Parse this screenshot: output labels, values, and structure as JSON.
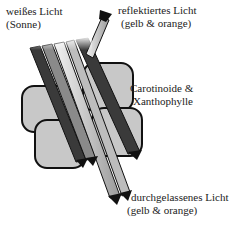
{
  "labels": {
    "incoming": {
      "line1": "weißes Licht",
      "line2": "(Sonne)"
    },
    "reflected": {
      "line1": "reflektiertes Licht",
      "line2": "(gelb & orange)"
    },
    "pigments": {
      "line1": "Carotinoide &",
      "line2": "Xanthophylle"
    },
    "transmitted": {
      "line1": "durchgelassenes Licht",
      "line2": "(gelb & orange)"
    }
  },
  "colors": {
    "blob_fill": "#c8c8c8",
    "blob_stroke": "#111111",
    "dark_band": "#3a3a3a",
    "mid_band": "#8a8a8a",
    "light_band": "#d9d9d9",
    "text": "#222222"
  }
}
